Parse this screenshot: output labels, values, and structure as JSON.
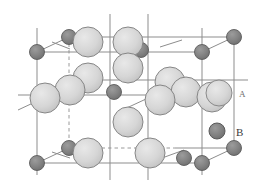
{
  "figure": {
    "background_color": "#ffffff"
  },
  "legend": {
    "items": [
      {
        "symbol": "A",
        "label": "A",
        "marker": "large-light-sphere",
        "fill_color": "#d2d2d2",
        "stroke_color": "#8a8a8a",
        "radius": 13
      },
      {
        "symbol": "B",
        "label": "B",
        "marker": "small-dark-sphere",
        "fill_color": "#7e7e7e",
        "stroke_color": "#5a5a5a",
        "radius": 8
      }
    ]
  },
  "cell": {
    "line_color": "#8d8d8d",
    "dashed_line_color": "#9a9a9a",
    "atom_a_fill": "#d2d2d2",
    "atom_a_stroke": "#868686",
    "atom_b_fill": "#7e7e7e",
    "atom_b_stroke": "#5c5c5c",
    "atom_a_radius": 15,
    "atom_b_radius": 7.5,
    "projection": "oblique",
    "atoms_a_count": 14,
    "atoms_b_count": 9
  }
}
